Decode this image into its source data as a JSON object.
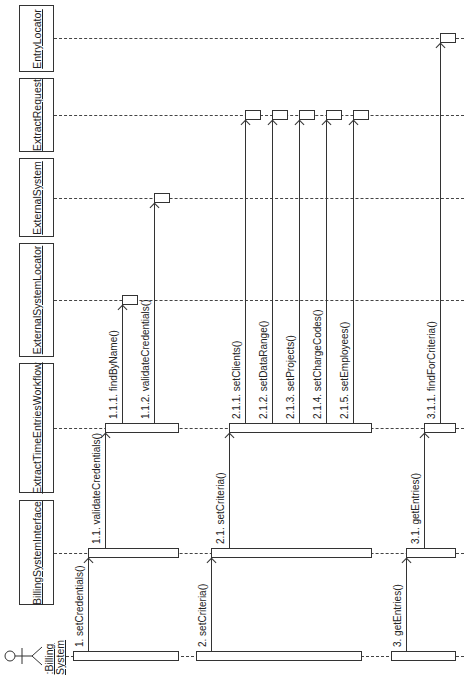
{
  "diagram": {
    "type": "UML sequence diagram (rotated 90° counter-clockwise)",
    "actor": {
      "name": ":Billing System",
      "line1": ":Billing",
      "line2": "System",
      "lifeline_y": 656
    },
    "objects": [
      {
        "id": "entry-locator",
        "name": "EntryLocator",
        "box_top": 5,
        "box_bottom": 72,
        "lifeline_y": 38
      },
      {
        "id": "extract-request",
        "name": "ExtractRequest",
        "box_top": 78,
        "box_bottom": 152,
        "lifeline_y": 115
      },
      {
        "id": "external-system",
        "name": "ExternalSystem",
        "box_top": 158,
        "box_bottom": 237,
        "lifeline_y": 198
      },
      {
        "id": "external-system-locator",
        "name": "ExternalSystemLocator",
        "box_top": 243,
        "box_bottom": 357,
        "lifeline_y": 300
      },
      {
        "id": "extract-time-entries-workflow",
        "name": "ExtractTimeEntriesWorkflow",
        "box_top": 363,
        "box_bottom": 493,
        "lifeline_y": 428
      },
      {
        "id": "billing-system-interface",
        "name": "BillingSystemInterface",
        "box_top": 500,
        "box_bottom": 605,
        "lifeline_y": 553
      }
    ],
    "messages": [
      {
        "id": "m1",
        "label": "1. setCredentials()",
        "x": 88,
        "from_y": 651,
        "to_y": 558
      },
      {
        "id": "m1_1",
        "label": "1.1. validateCredentials()",
        "x": 105,
        "from_y": 548,
        "to_y": 433
      },
      {
        "id": "m1_1_1",
        "label": "1.1.1. findByName()",
        "x": 122,
        "from_y": 423,
        "to_y": 305
      },
      {
        "id": "m1_1_2",
        "label": "1.1.2. validateCredentials()",
        "x": 154,
        "from_y": 423,
        "to_y": 203
      },
      {
        "id": "m2",
        "label": "2. setCriteria()",
        "x": 211,
        "from_y": 651,
        "to_y": 558
      },
      {
        "id": "m2_1",
        "label": "2.1. setCriteria()",
        "x": 229,
        "from_y": 548,
        "to_y": 433
      },
      {
        "id": "m2_1_1",
        "label": "2.1.1. setClients()",
        "x": 245,
        "from_y": 423,
        "to_y": 120
      },
      {
        "id": "m2_1_2",
        "label": "2.1.2. setDataRange()",
        "x": 272,
        "from_y": 423,
        "to_y": 120
      },
      {
        "id": "m2_1_3",
        "label": "2.1.3. setProjects()",
        "x": 299,
        "from_y": 423,
        "to_y": 120
      },
      {
        "id": "m2_1_4",
        "label": "2.1.4. setChargeCodes()",
        "x": 326,
        "from_y": 423,
        "to_y": 120
      },
      {
        "id": "m2_1_5",
        "label": "2.1.5. setEmployees()",
        "x": 353,
        "from_y": 423,
        "to_y": 120
      },
      {
        "id": "m3",
        "label": "3. getEntries()",
        "x": 406,
        "from_y": 651,
        "to_y": 558
      },
      {
        "id": "m3_1",
        "label": "3.1. getEntries()",
        "x": 424,
        "from_y": 548,
        "to_y": 433
      },
      {
        "id": "m3_1_1",
        "label": "3.1.1. findForCriteria()",
        "x": 440,
        "from_y": 423,
        "to_y": 43
      }
    ],
    "activations": [
      {
        "lifeline": "actor",
        "x1": 73,
        "x2": 179,
        "y": 656
      },
      {
        "lifeline": "actor",
        "x1": 196,
        "x2": 362,
        "y": 656
      },
      {
        "lifeline": "actor",
        "x1": 391,
        "x2": 456,
        "y": 656
      },
      {
        "lifeline": "billing-system-interface",
        "x1": 88,
        "x2": 179,
        "y": 553
      },
      {
        "lifeline": "billing-system-interface",
        "x1": 211,
        "x2": 372,
        "y": 553
      },
      {
        "lifeline": "billing-system-interface",
        "x1": 406,
        "x2": 456,
        "y": 553
      },
      {
        "lifeline": "extract-time-entries-workflow",
        "x1": 105,
        "x2": 179,
        "y": 428
      },
      {
        "lifeline": "extract-time-entries-workflow",
        "x1": 229,
        "x2": 372,
        "y": 428
      },
      {
        "lifeline": "extract-time-entries-workflow",
        "x1": 424,
        "x2": 456,
        "y": 428
      },
      {
        "lifeline": "external-system-locator",
        "x1": 122,
        "x2": 138,
        "y": 300
      },
      {
        "lifeline": "external-system",
        "x1": 154,
        "x2": 170,
        "y": 198
      },
      {
        "lifeline": "extract-request",
        "x1": 245,
        "x2": 261,
        "y": 115
      },
      {
        "lifeline": "extract-request",
        "x1": 272,
        "x2": 288,
        "y": 115
      },
      {
        "lifeline": "extract-request",
        "x1": 299,
        "x2": 315,
        "y": 115
      },
      {
        "lifeline": "extract-request",
        "x1": 326,
        "x2": 342,
        "y": 115
      },
      {
        "lifeline": "extract-request",
        "x1": 353,
        "x2": 369,
        "y": 115
      },
      {
        "lifeline": "entry-locator",
        "x1": 440,
        "x2": 456,
        "y": 38
      }
    ],
    "colors": {
      "line": "#333333",
      "background": "#ffffff",
      "text": "#222222"
    }
  }
}
